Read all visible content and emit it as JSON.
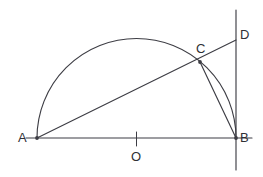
{
  "figure": {
    "background_color": "#ffffff",
    "stroke_color": "#3d3d44",
    "width": 263,
    "height": 177
  },
  "labels": {
    "a": "A",
    "b": "B",
    "c": "C",
    "d": "D",
    "o": "O"
  },
  "points": {
    "A": {
      "x": 37,
      "y": 138
    },
    "B": {
      "x": 236,
      "y": 138
    },
    "O": {
      "x": 136.5,
      "y": 138
    },
    "C": {
      "x": 200,
      "y": 62
    },
    "D": {
      "x": 236,
      "y": 40
    }
  },
  "geometry": {
    "diameter_line": {
      "x1": 26,
      "y1": 138,
      "x2": 252,
      "y2": 138
    },
    "semicircle": {
      "center_x": 136.5,
      "center_y": 138,
      "radius": 99.5,
      "path": "M 37 138 A 99.5 99.5 0 0 1 236 138"
    },
    "secant_AD": {
      "x1": 37,
      "y1": 138,
      "x2": 236,
      "y2": 40
    },
    "chord_CB": {
      "x1": 200,
      "y1": 62,
      "x2": 236,
      "y2": 138
    },
    "tangent_line": {
      "x1": 236,
      "y1": 10,
      "x2": 236,
      "y2": 170
    },
    "center_tick": {
      "x1": 136.5,
      "y1": 132,
      "x2": 136.5,
      "y2": 146
    }
  }
}
